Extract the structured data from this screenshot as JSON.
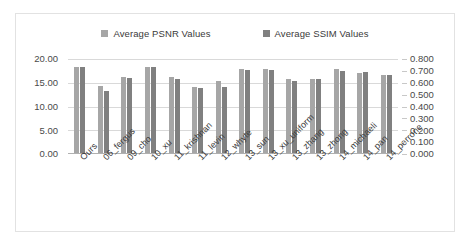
{
  "chart_data": {
    "type": "bar",
    "title": "",
    "subtitle": "",
    "xlabel": "",
    "ylabel": "",
    "grid": true,
    "legend_position": "top",
    "categories": [
      "Ours",
      "06_fergus",
      "09_cho",
      "10_xu",
      "11_krishnan",
      "11_levin",
      "12_whyte",
      "13_sun",
      "13_xu_uniform",
      "13_zhang",
      "13_zhong",
      "14_michaeli",
      "14_pan",
      "14_perrone"
    ],
    "series": [
      {
        "name": "Average PSNR Values",
        "axis": "left",
        "color": "#a6a6a6",
        "values": [
          18.2,
          14.3,
          16.2,
          18.3,
          16.2,
          14.0,
          15.3,
          17.8,
          17.8,
          15.8,
          15.8,
          17.8,
          17.0,
          16.5
        ]
      },
      {
        "name": "Average SSIM Values",
        "axis": "right",
        "color": "#808080",
        "values": [
          0.73,
          0.532,
          0.636,
          0.728,
          0.628,
          0.552,
          0.564,
          0.708,
          0.708,
          0.612,
          0.628,
          0.696,
          0.692,
          0.668
        ]
      }
    ],
    "left_axis": {
      "min": 0.0,
      "max": 20.0,
      "step": 5.0,
      "ticks": [
        "20.00",
        "15.00",
        "10.00",
        "5.00",
        "0.00"
      ]
    },
    "right_axis": {
      "min": 0.0,
      "max": 0.8,
      "step": 0.1,
      "ticks": [
        "0.800",
        "0.700",
        "0.600",
        "0.500",
        "0.400",
        "0.300",
        "0.200",
        "0.100",
        "0.000"
      ]
    }
  },
  "legend": {
    "entries": [
      {
        "label": "Average PSNR Values",
        "color": "#a6a6a6"
      },
      {
        "label": "Average SSIM Values",
        "color": "#808080"
      }
    ]
  },
  "colors": {
    "series_psnr": "#a6a6a6",
    "series_ssim": "#808080",
    "gridline": "#d9d9d9",
    "frame": "#e2e2e2",
    "text": "#3c3c3c"
  }
}
